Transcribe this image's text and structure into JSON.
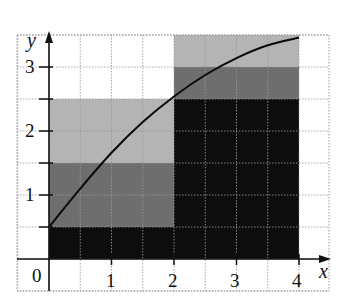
{
  "chart_data": {
    "type": "area",
    "title": "",
    "xlabel": "x",
    "ylabel": "y",
    "xlim": [
      0,
      4
    ],
    "ylim": [
      0,
      3.5
    ],
    "grid": true,
    "grid_step": 0.5,
    "x_ticks": [
      1,
      2,
      3,
      4
    ],
    "y_ticks": [
      1,
      2,
      3
    ],
    "origin_label": "0",
    "curve": {
      "name": "f(x)",
      "description": "increasing concave curve",
      "x": [
        0,
        0.5,
        1,
        1.5,
        2,
        2.5,
        3,
        3.5,
        4
      ],
      "y": [
        0.5,
        1.1,
        1.66,
        2.14,
        2.54,
        2.875,
        3.14,
        3.34,
        3.46
      ]
    },
    "rectangles": [
      {
        "x0": 0,
        "x1": 2,
        "y0": 0,
        "y1": 0.5,
        "shade": "black"
      },
      {
        "x0": 0,
        "x1": 2,
        "y0": 0.5,
        "y1": 1.5,
        "shade": "dark-gray"
      },
      {
        "x0": 0,
        "x1": 2,
        "y0": 1.5,
        "y1": 2.5,
        "shade": "light-gray"
      },
      {
        "x0": 2,
        "x1": 4,
        "y0": 0,
        "y1": 2.5,
        "shade": "black"
      },
      {
        "x0": 2,
        "x1": 4,
        "y0": 2.5,
        "y1": 3,
        "shade": "dark-gray"
      },
      {
        "x0": 2,
        "x1": 4,
        "y0": 3,
        "y1": 3.5,
        "shade": "light-gray"
      }
    ],
    "colors": {
      "black": "#0d0d0d",
      "dark-gray": "#6e6e6e",
      "light-gray": "#b4b4b4",
      "grid": "#9a9a9a",
      "axis": "#111111"
    }
  },
  "labels": {
    "x_axis": "x",
    "y_axis": "y",
    "origin": "0",
    "x_tick_1": "1",
    "x_tick_2": "2",
    "x_tick_3": "3",
    "x_tick_4": "4",
    "y_tick_1": "1",
    "y_tick_2": "2",
    "y_tick_3": "3"
  }
}
